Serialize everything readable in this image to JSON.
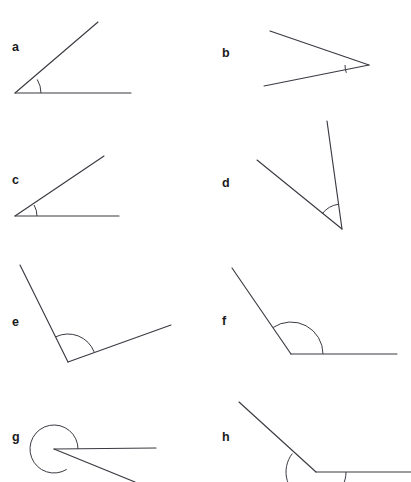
{
  "figure": {
    "width": 411,
    "height": 482,
    "background_color": "#ffffff",
    "stroke_color": "#3a3a42",
    "label_color": "#1a1a1a"
  },
  "items": [
    {
      "label": "a",
      "label_pos": {
        "x": 12,
        "y": 51
      },
      "angle_type": "acute",
      "vertex": {
        "x": 15,
        "y": 93
      },
      "rays": [
        {
          "name": "ray-horizontal-right",
          "x": 131,
          "y": 93
        },
        {
          "name": "ray-upper-right",
          "x": 98,
          "y": 22
        }
      ],
      "arc": {
        "radius": 26,
        "start_deg": 0,
        "end_deg": 31.5,
        "sweep": "minor"
      },
      "measure_deg": 32
    },
    {
      "label": "b",
      "label_pos": {
        "x": 222,
        "y": 57
      },
      "angle_type": "acute",
      "vertex": {
        "x": 369,
        "y": 65
      },
      "rays": [
        {
          "name": "ray-upper-left",
          "x": 270,
          "y": 31
        },
        {
          "name": "ray-lower-left",
          "x": 264,
          "y": 86
        }
      ],
      "arc": {
        "radius": 24,
        "start_deg": 180,
        "end_deg": 199,
        "sweep": "minor"
      },
      "measure_deg": 31
    },
    {
      "label": "c",
      "label_pos": {
        "x": 12,
        "y": 184
      },
      "angle_type": "acute",
      "vertex": {
        "x": 15,
        "y": 216
      },
      "rays": [
        {
          "name": "ray-horizontal-right",
          "x": 119,
          "y": 216
        },
        {
          "name": "ray-upper-right",
          "x": 104,
          "y": 156
        }
      ],
      "arc": {
        "radius": 22,
        "start_deg": 0,
        "end_deg": 30,
        "sweep": "minor"
      },
      "measure_deg": 30
    },
    {
      "label": "d",
      "label_pos": {
        "x": 222,
        "y": 187
      },
      "angle_type": "acute",
      "vertex": {
        "x": 342,
        "y": 229
      },
      "rays": [
        {
          "name": "ray-upper-slightly-left",
          "x": 327,
          "y": 121
        },
        {
          "name": "ray-upper-left",
          "x": 257,
          "y": 160
        }
      ],
      "arc": {
        "radius": 25,
        "start_deg": 98,
        "end_deg": 143,
        "sweep": "minor"
      },
      "measure_deg": 44
    },
    {
      "label": "e",
      "label_pos": {
        "x": 12,
        "y": 326
      },
      "angle_type": "obtuse",
      "vertex": {
        "x": 68,
        "y": 362
      },
      "rays": [
        {
          "name": "ray-upper-left",
          "x": 20,
          "y": 265
        },
        {
          "name": "ray-upper-right",
          "x": 171,
          "y": 325
        }
      ],
      "arc": {
        "radius": 28,
        "start_deg": 21,
        "end_deg": 116,
        "sweep": "minor"
      },
      "measure_deg": 95
    },
    {
      "label": "f",
      "label_pos": {
        "x": 222,
        "y": 325
      },
      "angle_type": "obtuse",
      "vertex": {
        "x": 291,
        "y": 354
      },
      "rays": [
        {
          "name": "ray-horizontal-right",
          "x": 397,
          "y": 354
        },
        {
          "name": "ray-upper-left",
          "x": 232,
          "y": 268
        }
      ],
      "arc": {
        "radius": 32,
        "start_deg": 0,
        "end_deg": 124,
        "sweep": "minor"
      },
      "measure_deg": 124
    },
    {
      "label": "g",
      "label_pos": {
        "x": 12,
        "y": 441
      },
      "angle_type": "reflex",
      "vertex": {
        "x": 54,
        "y": 449
      },
      "rays": [
        {
          "name": "ray-horizontal-right",
          "x": 156,
          "y": 448
        },
        {
          "name": "ray-lower-right",
          "x": 135,
          "y": 482
        }
      ],
      "arc": {
        "radius": 24,
        "start_deg": 0,
        "end_deg": 302,
        "sweep": "reflex"
      },
      "measure_deg": 302
    },
    {
      "label": "h",
      "label_pos": {
        "x": 222,
        "y": 441
      },
      "angle_type": "reflex",
      "vertex": {
        "x": 316,
        "y": 472
      },
      "rays": [
        {
          "name": "ray-horizontal-right",
          "x": 411,
          "y": 472
        },
        {
          "name": "ray-upper-left",
          "x": 239,
          "y": 402
        }
      ],
      "arc": {
        "radius": 30,
        "start_deg": 0,
        "end_deg": -218,
        "sweep": "reflex"
      },
      "measure_deg": 218
    }
  ]
}
